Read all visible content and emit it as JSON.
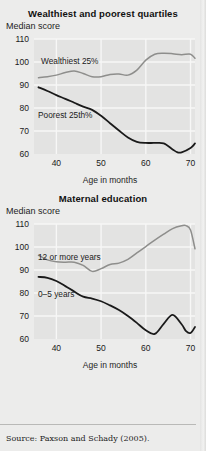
{
  "source_note": "Source: Paxson and Schady (2005).",
  "colors": {
    "background": "#ececeb",
    "plot_background": "#e3e3e2",
    "gridline": "#f7f7f6",
    "series_gray": "#8e8e8c",
    "series_black": "#1a1a1a",
    "text": "#1a1a1a"
  },
  "charts": [
    {
      "title": "Wealthiest and poorest quartiles",
      "y_axis_title": "Median score",
      "x_axis_title": "Age in months",
      "y_ticks": [
        "110",
        "100",
        "90",
        "80",
        "70",
        "60"
      ],
      "x_ticks": [
        "40",
        "50",
        "60",
        "70"
      ],
      "series_labels": {
        "gray": "Wealthiest 25%",
        "black": "Poorest 25th%"
      }
    },
    {
      "title": "Maternal education",
      "y_axis_title": "Median score",
      "x_axis_title": "Age in months",
      "y_ticks": [
        "110",
        "100",
        "90",
        "80",
        "70",
        "60"
      ],
      "x_ticks": [
        "40",
        "50",
        "60",
        "70"
      ],
      "series_labels": {
        "gray": "12 or more years",
        "black": "0–5 years"
      }
    }
  ],
  "chart_data": [
    {
      "type": "line",
      "title": "Wealthiest and poorest quartiles",
      "xlabel": "Age in months",
      "ylabel": "Median score",
      "xlim": [
        35,
        71
      ],
      "ylim": [
        60,
        110
      ],
      "y_ticks": [
        60,
        70,
        80,
        90,
        100,
        110
      ],
      "x_ticks": [
        40,
        50,
        60,
        70
      ],
      "grid": true,
      "legend": "inline-annotations",
      "series": [
        {
          "name": "Wealthiest 25%",
          "color": "#8e8e8c",
          "x": [
            36,
            38,
            40,
            42,
            44,
            46,
            48,
            50,
            52,
            54,
            56,
            58,
            60,
            62,
            64,
            66,
            68,
            70,
            71
          ],
          "values": [
            93.2,
            93.6,
            94.3,
            95.4,
            96.1,
            95.0,
            93.6,
            93.6,
            94.6,
            94.8,
            94.3,
            96.5,
            100.8,
            103.4,
            103.8,
            103.6,
            103.2,
            103.4,
            101.6
          ]
        },
        {
          "name": "Poorest 25th%",
          "color": "#1a1a1a",
          "x": [
            36,
            38,
            40,
            42,
            44,
            46,
            48,
            50,
            52,
            54,
            56,
            58,
            60,
            62,
            64,
            66,
            67,
            68,
            70,
            71
          ],
          "values": [
            89.0,
            87.4,
            85.6,
            84.0,
            82.3,
            80.6,
            79.2,
            76.6,
            73.4,
            70.2,
            67.2,
            65.3,
            64.8,
            64.8,
            64.6,
            62.0,
            60.8,
            60.7,
            62.6,
            64.6
          ]
        }
      ]
    },
    {
      "type": "line",
      "title": "Maternal education",
      "xlabel": "Age in months",
      "ylabel": "Median score",
      "xlim": [
        35,
        71
      ],
      "ylim": [
        60,
        110
      ],
      "y_ticks": [
        60,
        70,
        80,
        90,
        100,
        110
      ],
      "x_ticks": [
        40,
        50,
        60,
        70
      ],
      "grid": true,
      "legend": "inline-annotations",
      "series": [
        {
          "name": "12 or more years",
          "color": "#8e8e8c",
          "x": [
            36,
            38,
            40,
            42,
            44,
            46,
            48,
            50,
            52,
            54,
            56,
            58,
            60,
            62,
            64,
            66,
            68,
            69,
            70,
            71
          ],
          "values": [
            96.4,
            94.4,
            93.6,
            93.4,
            93.4,
            92.0,
            89.4,
            90.6,
            92.4,
            93.0,
            94.6,
            97.4,
            100.2,
            103.0,
            105.6,
            108.0,
            109.2,
            109.3,
            107.4,
            99.2
          ]
        },
        {
          "name": "0–5 years",
          "color": "#1a1a1a",
          "x": [
            36,
            38,
            40,
            42,
            44,
            46,
            48,
            50,
            52,
            54,
            56,
            58,
            60,
            62,
            64,
            66,
            68,
            69,
            70,
            71
          ],
          "values": [
            87.0,
            86.6,
            85.2,
            83.0,
            80.6,
            78.4,
            77.6,
            76.4,
            74.6,
            72.6,
            70.0,
            67.0,
            63.8,
            62.2,
            66.6,
            70.5,
            66.4,
            63.4,
            62.6,
            65.2
          ]
        }
      ]
    }
  ]
}
